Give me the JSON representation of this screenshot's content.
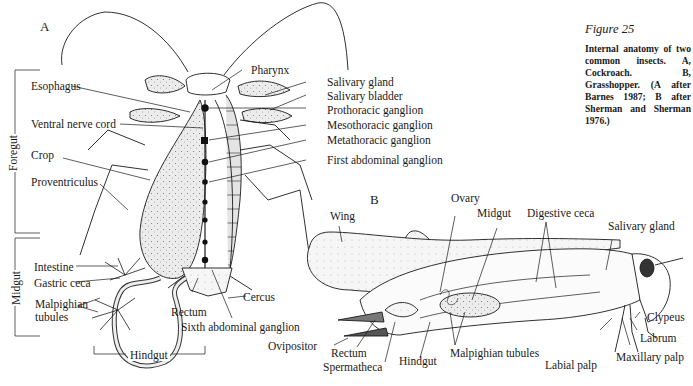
{
  "figure": {
    "number": "Figure 25",
    "caption": "Internal anatomy of two common insects. A, Cockroach. B, Grasshopper. (A after Barnes 1987; B after Sherman and Sherman 1976.)"
  },
  "panel_a": {
    "letter": "A",
    "subject": "Cockroach",
    "region_brackets": {
      "foregut": "Foregut",
      "midgut": "Midgut",
      "hindgut": "Hindgut"
    },
    "labels_left": {
      "esophagus": "Esophagus",
      "ventral_nerve_cord": "Ventral nerve cord",
      "crop": "Crop",
      "proventriculus": "Proventriculus",
      "intestine": "Intestine",
      "gastric_ceca": "Gastric ceca",
      "malpighian_tubules_1": "Malpighian",
      "malpighian_tubules_2": "tubules"
    },
    "labels_right": {
      "pharynx": "Pharynx",
      "salivary_gland": "Salivary gland",
      "salivary_bladder": "Salivary bladder",
      "prothoracic_ganglion": "Prothoracic ganglion",
      "mesothoracic_ganglion": "Mesothoracic ganglion",
      "metathoracic_ganglion": "Metathoracic ganglion",
      "first_abdominal_ganglion": "First abdominal ganglion"
    },
    "labels_bottom": {
      "rectum": "Rectum",
      "cercus": "Cercus",
      "sixth_abdominal_ganglion": "Sixth abdominal ganglion"
    }
  },
  "panel_b": {
    "letter": "B",
    "subject": "Grasshopper",
    "labels": {
      "wing": "Wing",
      "ovary": "Ovary",
      "midgut": "Midgut",
      "digestive_ceca": "Digestive ceca",
      "salivary_gland": "Salivary gland",
      "clypeus": "Clypeus",
      "labrum": "Labrum",
      "maxillary_palp": "Maxillary palp",
      "labial_palp": "Labial palp",
      "malpighian_tubules": "Malpighian tubules",
      "hindgut": "Hindgut",
      "spermatheca": "Spermatheca",
      "rectum": "Rectum",
      "ovipositor": "Ovipositor"
    }
  },
  "colors": {
    "ink": "#1a1a1a",
    "stipple": "#d8d8d8",
    "background": "#ffffff"
  }
}
